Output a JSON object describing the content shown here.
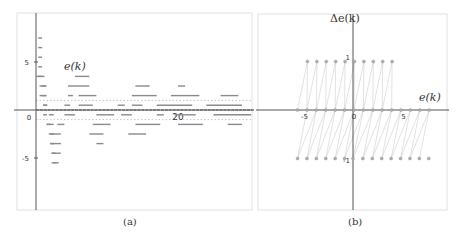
{
  "chart_data": [
    {
      "panel": "a",
      "type": "scatter",
      "caption": "(a)",
      "title": "",
      "series_label": "e(k)",
      "xlabel": "",
      "ylabel": "",
      "x_ticks": [
        {
          "value": 0,
          "label": "0"
        },
        {
          "value": 20,
          "label": "20"
        }
      ],
      "y_ticks": [
        {
          "value": 5,
          "label": "5"
        },
        {
          "value": -5,
          "label": "-5"
        }
      ],
      "xlim": [
        -2.5,
        30.5
      ],
      "ylim": [
        -10.2,
        10.2
      ],
      "grid": false,
      "reference_lines_y": [
        1,
        -1
      ],
      "description": "Error trajectories e(k) over time k for multiple initial conditions; values settle on a quantized grid and converge into the band [-1, 1].",
      "points": [
        {
          "k": 0.3,
          "e": 7.5
        },
        {
          "k": 0.3,
          "e": 6.5
        },
        {
          "k": 0.3,
          "e": 5.5
        },
        {
          "k": 0.3,
          "e": 4.5
        },
        {
          "k": 0.3,
          "e": 3.5
        },
        {
          "k": 0.8,
          "e": 2.5
        },
        {
          "k": 0.8,
          "e": 1.5
        },
        {
          "k": 1.0,
          "e": 0.5
        },
        {
          "k": 1.0,
          "e": -0.5
        },
        {
          "k": 1.5,
          "e": -1.5
        },
        {
          "k": 2.0,
          "e": -2.5
        },
        {
          "k": 2.0,
          "e": -3.5
        },
        {
          "k": 2.2,
          "e": -4.5
        },
        {
          "k": 2.2,
          "e": -5.5
        }
      ],
      "levels": [
        {
          "e": 3.5,
          "segments": [
            [
              0,
              1.2
            ],
            [
              5.5,
              7.5
            ]
          ]
        },
        {
          "e": 2.5,
          "segments": [
            [
              0.5,
              1.5
            ],
            [
              4.5,
              7.5
            ],
            [
              14,
              16
            ],
            [
              20,
              21
            ]
          ]
        },
        {
          "e": 1.5,
          "segments": [
            [
              0.5,
              1.5
            ],
            [
              4.5,
              5.2
            ],
            [
              6,
              8.5
            ],
            [
              13.5,
              17
            ],
            [
              19,
              23
            ],
            [
              26,
              28.5
            ],
            [
              33,
              34
            ]
          ]
        },
        {
          "e": 0.5,
          "segments": [
            [
              1,
              1.6
            ],
            [
              4,
              4.8
            ],
            [
              6,
              8
            ],
            [
              11.5,
              12.5
            ],
            [
              13.5,
              15
            ],
            [
              17,
              22
            ],
            [
              24,
              29
            ],
            [
              31,
              35.5
            ],
            [
              39,
              42.5
            ]
          ]
        },
        {
          "e": 0,
          "segments": [
            [
              0,
              30.5
            ]
          ]
        },
        {
          "e": -0.5,
          "segments": [
            [
              1.8,
              2.5
            ],
            [
              4,
              5.5
            ],
            [
              8.5,
              11
            ],
            [
              12,
              13.5
            ],
            [
              17,
              18
            ],
            [
              19.5,
              22.5
            ],
            [
              25,
              31
            ],
            [
              34,
              37
            ],
            [
              38,
              41
            ],
            [
              44,
              48
            ]
          ]
        },
        {
          "e": -1.5,
          "segments": [
            [
              1.5,
              2.5
            ],
            [
              3,
              4
            ],
            [
              8,
              10.5
            ],
            [
              14,
              17.5
            ],
            [
              20,
              23.5
            ],
            [
              27,
              29
            ],
            [
              32,
              33
            ]
          ]
        },
        {
          "e": -2.5,
          "segments": [
            [
              1.8,
              3.5
            ],
            [
              7.5,
              9.5
            ],
            [
              13,
              15.5
            ]
          ]
        },
        {
          "e": -3.5,
          "segments": [
            [
              2,
              3.5
            ],
            [
              8.5,
              9.5
            ]
          ]
        },
        {
          "e": -4.5,
          "segments": [
            [
              2.2,
              3.5
            ]
          ]
        },
        {
          "e": -5.5,
          "segments": [
            [
              2.5,
              3.2
            ]
          ]
        }
      ]
    },
    {
      "panel": "b",
      "type": "scatter",
      "caption": "(b)",
      "title": "",
      "xlabel": "e(k)",
      "ylabel": "Δe(k)",
      "x_ticks": [
        {
          "value": -5,
          "label": "-5"
        },
        {
          "value": 0,
          "label": "0"
        },
        {
          "value": 5,
          "label": "5"
        }
      ],
      "y_ticks": [
        {
          "value": 1,
          "label": "1"
        },
        {
          "value": -1,
          "label": "-1"
        }
      ],
      "xlim": [
        -9.6,
        9.6
      ],
      "ylim": [
        -2.0,
        2.0
      ],
      "grid": false,
      "description": "Phase-plane plot of Δe(k) versus e(k); points lie on Δe = 1, 0, -1 with thin lines connecting successive states.",
      "series": [
        {
          "name": "Δe = 1",
          "x": [
            -4.6,
            -3.65,
            -2.7,
            -1.75,
            -0.8,
            0.15,
            1.1,
            2.05,
            3.0,
            3.95
          ],
          "y": 1
        },
        {
          "name": "Δe = 0",
          "x": [
            -5.6,
            -4.65,
            -3.7,
            -2.75,
            -1.8,
            -0.85,
            0.1,
            1.05,
            2.0,
            2.95,
            3.9,
            4.85,
            5.8,
            6.75,
            7.7
          ],
          "y": 0
        },
        {
          "name": "Δe = -1",
          "x": [
            -5.6,
            -4.65,
            -3.7,
            -2.75,
            -1.8,
            -0.85,
            0.0,
            1.0,
            1.95,
            2.9,
            3.85,
            4.8,
            5.75,
            6.7,
            7.65
          ],
          "y": -1
        }
      ]
    }
  ]
}
